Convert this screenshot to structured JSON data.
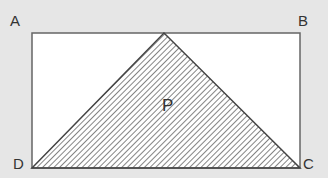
{
  "figure": {
    "labels": {
      "A": "A",
      "B": "B",
      "C": "C",
      "D": "D",
      "P": "P"
    },
    "colors": {
      "background": "#e6e6e6",
      "rect_fill": "#ffffff",
      "stroke": "#555555",
      "hatch": "#666666"
    }
  }
}
